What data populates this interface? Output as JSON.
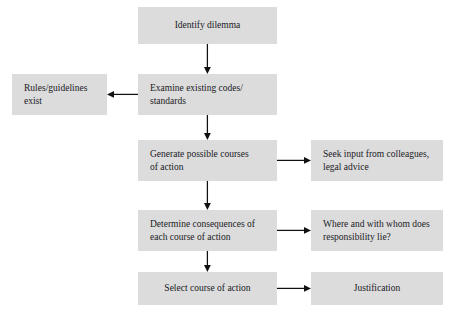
{
  "diagram": {
    "style": {
      "node_fill": "#dcdcdc",
      "text_color": "#20201f",
      "arrow_color": "#111111",
      "background": "#ffffff"
    },
    "nodes": [
      {
        "id": "identify-dilemma",
        "label": "Identify dilemma",
        "align": "center",
        "x": 138,
        "y": 7,
        "w": 139,
        "h": 37
      },
      {
        "id": "examine-existing-codes",
        "label": "Examine existing codes/\nstandards",
        "align": "left",
        "x": 138,
        "y": 74,
        "w": 139,
        "h": 41
      },
      {
        "id": "rules-guidelines-exist",
        "label": "Rules/guidelines\nexist",
        "align": "left",
        "x": 12,
        "y": 74,
        "w": 95,
        "h": 41
      },
      {
        "id": "generate-possible-courses",
        "label": "Generate possible courses\nof action",
        "align": "left",
        "x": 138,
        "y": 140,
        "w": 139,
        "h": 41
      },
      {
        "id": "seek-input-colleagues",
        "label": "Seek input from colleagues,\nlegal advice",
        "align": "left",
        "x": 311,
        "y": 140,
        "w": 132,
        "h": 41
      },
      {
        "id": "determine-consequences",
        "label": "Determine consequences of\neach course of action",
        "align": "left",
        "x": 138,
        "y": 210,
        "w": 139,
        "h": 41
      },
      {
        "id": "responsibility-lie",
        "label": "Where and with whom does\nresponsibility lie?",
        "align": "left",
        "x": 311,
        "y": 210,
        "w": 132,
        "h": 41
      },
      {
        "id": "select-course-of-action",
        "label": "Select course of action",
        "align": "center",
        "x": 138,
        "y": 272,
        "w": 139,
        "h": 33
      },
      {
        "id": "justification",
        "label": "Justification",
        "align": "center",
        "x": 311,
        "y": 272,
        "w": 132,
        "h": 33
      }
    ],
    "connectors": [
      {
        "id": "identify-to-examine",
        "from": "identify-dilemma",
        "to": "examine-existing-codes",
        "direction": "down"
      },
      {
        "id": "examine-to-rules",
        "from": "examine-existing-codes",
        "to": "rules-guidelines-exist",
        "direction": "left"
      },
      {
        "id": "examine-to-generate",
        "from": "examine-existing-codes",
        "to": "generate-possible-courses",
        "direction": "down"
      },
      {
        "id": "generate-to-seek-input",
        "from": "generate-possible-courses",
        "to": "seek-input-colleagues",
        "direction": "right"
      },
      {
        "id": "generate-to-determine",
        "from": "generate-possible-courses",
        "to": "determine-consequences",
        "direction": "down"
      },
      {
        "id": "determine-to-responsibility",
        "from": "determine-consequences",
        "to": "responsibility-lie",
        "direction": "right"
      },
      {
        "id": "determine-to-select",
        "from": "determine-consequences",
        "to": "select-course-of-action",
        "direction": "down"
      },
      {
        "id": "select-to-justification",
        "from": "select-course-of-action",
        "to": "justification",
        "direction": "right"
      }
    ]
  }
}
